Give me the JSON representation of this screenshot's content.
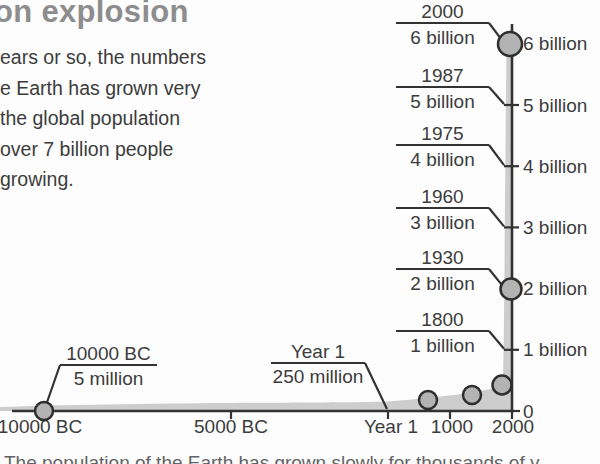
{
  "colors": {
    "heading": "#8d8d8d",
    "text": "#3c3c3c",
    "line": "#333333",
    "marker_fill": "#b3b3b3",
    "marker_stroke": "#2e2e2e",
    "area_fill": "#cdcdcd",
    "background": "#fdfdfd"
  },
  "header": {
    "title_fragment": "on explosion"
  },
  "intro": {
    "lines": [
      "ears or so, the numbers",
      "e Earth has grown very",
      "the global population",
      "over 7 billion people",
      "growing."
    ]
  },
  "caption": {
    "clipped_text": "The population of the Earth has grown slowly for thousands of y"
  },
  "chart_data": {
    "type": "area",
    "title": "",
    "xlabel": "",
    "ylabel": "",
    "x_tick_labels": [
      "10000 BC",
      "5000 BC",
      "Year 1",
      "1000",
      "2000"
    ],
    "y_tick_labels": [
      "0",
      "1 billion",
      "2 billion",
      "3 billion",
      "4 billion",
      "5 billion",
      "6 billion"
    ],
    "ylim_billions": [
      0,
      6
    ],
    "grid": false,
    "legend": "none",
    "milestones": [
      {
        "year": "10000 BC",
        "population": "5 million"
      },
      {
        "year": "Year 1",
        "population": "250 million"
      },
      {
        "year": "1800",
        "population": "1 billion"
      },
      {
        "year": "1930",
        "population": "2 billion"
      },
      {
        "year": "1960",
        "population": "3 billion"
      },
      {
        "year": "1975",
        "population": "4 billion"
      },
      {
        "year": "1987",
        "population": "5 billion"
      },
      {
        "year": "2000",
        "population": "6 billion"
      }
    ]
  },
  "chart_geom": {
    "width": 600,
    "height": 464,
    "axis_x": 512,
    "axis_top": 24,
    "y0": 411,
    "px_per_billion": 61.2,
    "x_axis_start": 12,
    "x_ticks": [
      {
        "label": "10000 BC",
        "x": 44,
        "tick": false,
        "label_x": 40
      },
      {
        "label": "5000 BC",
        "x": 231,
        "tick": true,
        "label_x": 231
      },
      {
        "label": "Year 1",
        "x": 388,
        "tick": true,
        "label_x": 391
      },
      {
        "label": "1000",
        "x": 450,
        "tick": true,
        "label_x": 452
      },
      {
        "label": "2000",
        "x": 512,
        "tick": true,
        "label_x": 513
      }
    ],
    "y_ticks": [
      {
        "label": "0",
        "v": 0,
        "tick": false
      },
      {
        "label": "1 billion",
        "v": 1,
        "tick": true
      },
      {
        "label": "2 billion",
        "v": 2,
        "tick": true
      },
      {
        "label": "3 billion",
        "v": 3,
        "tick": true
      },
      {
        "label": "4 billion",
        "v": 4,
        "tick": true
      },
      {
        "label": "5 billion",
        "v": 5,
        "tick": true
      },
      {
        "label": "6 billion",
        "v": 6,
        "tick": false
      }
    ],
    "callout_x1": 396,
    "callout_x2": 489,
    "callout_end_x": 504,
    "right_callouts": [
      {
        "year": "2000",
        "value": "6 billion",
        "v": 6,
        "underline_y": 23
      },
      {
        "year": "1987",
        "value": "5 billion",
        "v": 5,
        "underline_y": 87
      },
      {
        "year": "1975",
        "value": "4 billion",
        "v": 4,
        "underline_y": 145
      },
      {
        "year": "1960",
        "value": "3 billion",
        "v": 3,
        "underline_y": 208
      },
      {
        "year": "1930",
        "value": "2 billion",
        "v": 2,
        "underline_y": 269
      },
      {
        "year": "1800",
        "value": "1 billion",
        "v": 1,
        "underline_y": 331
      }
    ],
    "left_callouts": [
      {
        "year": "10000 BC",
        "value": "5 million",
        "x1": 60,
        "x2": 157,
        "uy": 365,
        "end_x": 45,
        "end_y": 408,
        "from": "left"
      },
      {
        "year": "Year 1",
        "value": "250 million",
        "x1": 271,
        "x2": 365,
        "uy": 363,
        "end_x": 387,
        "end_y": 409,
        "from": "right"
      }
    ],
    "markers": [
      {
        "x": 44,
        "y": 411,
        "r": 9
      },
      {
        "x": 428,
        "y": 400,
        "r": 9
      },
      {
        "x": 472,
        "y": 395,
        "r": 9
      },
      {
        "x": 502,
        "y": 385,
        "r": 9.5
      },
      {
        "x": 511,
        "y": 289,
        "r": 10.5
      },
      {
        "x": 510,
        "y": 44,
        "r": 12
      }
    ],
    "area_path": "M0,407 C60,405 150,403.5 231,403 C300,402.5 355,402.5 388,401.5 C420,399 452,396 480,391 C492,389 500,387 503,380 C504,356 505,200 506.5,46 L513,44 L513,411 L0,411 Z"
  }
}
